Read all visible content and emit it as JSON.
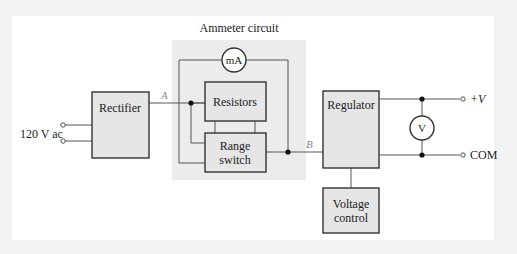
{
  "title": "Ammeter circuit",
  "blocks": {
    "rectifier": "Rectifier",
    "resistors": "Resistors",
    "range_switch_line1": "Range",
    "range_switch_line2": "switch",
    "regulator": "Regulator",
    "voltage_control_line1": "Voltage",
    "voltage_control_line2": "control"
  },
  "meters": {
    "ammeter": "mA",
    "voltmeter": "V"
  },
  "labels": {
    "input": "120 V ac",
    "node_a": "A",
    "node_b": "B",
    "out_pos": "+V",
    "out_com": "COM"
  },
  "colors": {
    "block_fill": "#e6e6e6",
    "ammeter_region": "#ececec",
    "line": "#555555",
    "node_label": "#888888"
  }
}
